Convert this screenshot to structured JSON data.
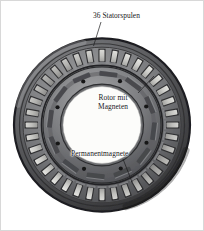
{
  "figure": {
    "background_color": "#ffffff",
    "border_color": "#d8d8d8",
    "width_px": 204,
    "height_px": 231
  },
  "annotations": {
    "stator": {
      "label": "36 Statorspulen",
      "leader_from": [
        100,
        22
      ],
      "leader_to": [
        92,
        44
      ]
    },
    "rotor": {
      "line1": "Rotor mit",
      "line2": "Magneten",
      "leader_from": [
        136,
        92
      ],
      "leader_to": [
        152,
        76
      ]
    },
    "magnets": {
      "label": "Permanentmagnete",
      "leader_from": [
        122,
        159
      ],
      "leader_to": [
        131,
        180
      ]
    }
  },
  "photo": {
    "alt": "Grayscale cross-section photograph of a permanent-magnet synchronous motor",
    "center": [
      101,
      123
    ],
    "stator_outer_radius_px": 88,
    "stator_teeth_count": 36,
    "rotor_outer_radius_px": 58,
    "rotor_inner_radius_px": 40,
    "magnet_count": 12,
    "colors": {
      "housing_dark": "#3a3a3c",
      "housing_mid": "#6f7073",
      "lamination_gray": "#8b8c8f",
      "coil_light": "#d9d9d6",
      "coil_shadow": "#2a2a2c",
      "rotor_gray": "#7d7e81",
      "rotor_dark": "#45464a",
      "bore_white": "#fdfdfb",
      "bolt_black": "#171718"
    }
  }
}
